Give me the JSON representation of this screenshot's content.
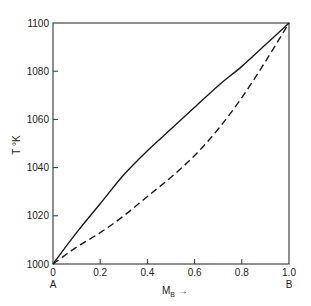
{
  "chart_data": {
    "type": "line",
    "title": "",
    "xlabel": "M_B →",
    "xlabel_main": "M",
    "xlabel_sub": "B",
    "xlabel_arrow": "→",
    "ylabel": "T °K",
    "xlim": [
      0,
      1.0
    ],
    "ylim": [
      1000,
      1100
    ],
    "grid": false,
    "legend": null,
    "x_ticks": [
      "0",
      "0.2",
      "0.4",
      "0.6",
      "0.8",
      "1.0"
    ],
    "y_ticks": [
      "1000",
      "1020",
      "1040",
      "1060",
      "1080",
      "1100"
    ],
    "annotations": [
      {
        "text": "A",
        "x": 0,
        "position": "below x-axis"
      },
      {
        "text": "B",
        "x": 1.0,
        "position": "below x-axis"
      }
    ],
    "x": [
      0,
      0.1,
      0.2,
      0.3,
      0.4,
      0.5,
      0.6,
      0.7,
      0.8,
      0.9,
      1.0
    ],
    "series": [
      {
        "name": "solid curve",
        "style": "solid",
        "values": [
          1000,
          1013,
          1025,
          1037,
          1047,
          1056,
          1065,
          1074,
          1082,
          1091,
          1100
        ]
      },
      {
        "name": "dashed curve",
        "style": "dashed",
        "values": [
          1000,
          1007,
          1013,
          1020,
          1028,
          1036,
          1045,
          1056,
          1069,
          1084,
          1100
        ]
      }
    ]
  },
  "colors": {
    "axis": "#333333",
    "line": "#1a1a1a",
    "background": "#ffffff"
  }
}
